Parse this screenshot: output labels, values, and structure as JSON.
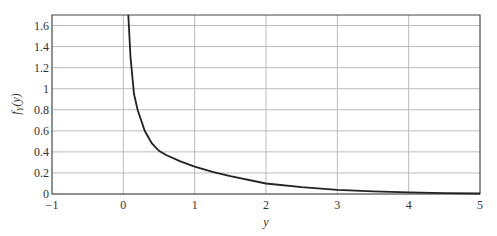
{
  "chart_data": {
    "type": "line",
    "title": "",
    "xlabel": "y",
    "ylabel": "f_Y(y)",
    "xlim": [
      -1,
      5
    ],
    "ylim": [
      0,
      1.7
    ],
    "grid": true,
    "legend": null,
    "x_ticks": [
      "-1",
      "0",
      "1",
      "2",
      "3",
      "4",
      "5"
    ],
    "y_ticks": [
      "0",
      "0.2",
      "0.4",
      "0.6",
      "0.8",
      "1",
      "1.2",
      "1.4",
      "1.6"
    ],
    "series": [
      {
        "name": "f_Y(y)",
        "x": [
          0.07,
          0.1,
          0.15,
          0.2,
          0.3,
          0.4,
          0.5,
          0.6,
          0.8,
          1.0,
          1.25,
          1.5,
          2.0,
          2.5,
          3.0,
          3.5,
          4.0,
          4.5,
          5.0
        ],
        "y": [
          1.7,
          1.3,
          0.95,
          0.8,
          0.6,
          0.48,
          0.41,
          0.37,
          0.31,
          0.26,
          0.21,
          0.17,
          0.1,
          0.065,
          0.04,
          0.025,
          0.015,
          0.009,
          0.005
        ]
      }
    ]
  }
}
